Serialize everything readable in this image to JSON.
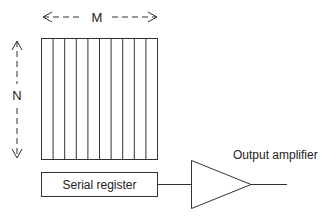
{
  "diagram": {
    "dimensions": {
      "width_label": "M",
      "height_label": "N"
    },
    "pixel_array": {
      "columns": 10
    },
    "components": {
      "serial_register": "Serial register",
      "output_amplifier": "Output amplifier"
    },
    "colors": {
      "line": "#333333",
      "text": "#222222",
      "background": "#ffffff"
    }
  }
}
